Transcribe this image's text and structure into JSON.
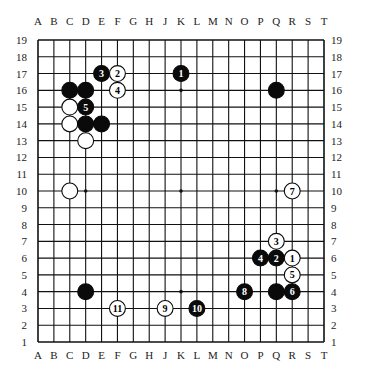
{
  "board": {
    "size": 19,
    "columns": [
      "A",
      "B",
      "C",
      "D",
      "E",
      "F",
      "G",
      "H",
      "J",
      "K",
      "L",
      "M",
      "N",
      "O",
      "P",
      "Q",
      "R",
      "S",
      "T"
    ],
    "rows": [
      19,
      18,
      17,
      16,
      15,
      14,
      13,
      12,
      11,
      10,
      9,
      8,
      7,
      6,
      5,
      4,
      3,
      2,
      1
    ],
    "star_points": [
      "D10",
      "K10",
      "Q10",
      "K16",
      "K4"
    ],
    "colors": {
      "line": "#111111",
      "black": "#0a0a0a",
      "white": "#ffffff",
      "background": "#ffffff"
    }
  },
  "stones": [
    {
      "pos": "E17",
      "color": "black",
      "label": "3"
    },
    {
      "pos": "F17",
      "color": "white",
      "label": "2"
    },
    {
      "pos": "K17",
      "color": "black",
      "label": "1"
    },
    {
      "pos": "C16",
      "color": "black",
      "label": ""
    },
    {
      "pos": "D16",
      "color": "black",
      "label": ""
    },
    {
      "pos": "F16",
      "color": "white",
      "label": "4"
    },
    {
      "pos": "Q16",
      "color": "black",
      "label": ""
    },
    {
      "pos": "C15",
      "color": "white",
      "label": ""
    },
    {
      "pos": "D15",
      "color": "black",
      "label": "5"
    },
    {
      "pos": "C14",
      "color": "white",
      "label": ""
    },
    {
      "pos": "D14",
      "color": "black",
      "label": ""
    },
    {
      "pos": "E14",
      "color": "black",
      "label": ""
    },
    {
      "pos": "D13",
      "color": "white",
      "label": ""
    },
    {
      "pos": "C10",
      "color": "white",
      "label": ""
    },
    {
      "pos": "R10",
      "color": "white",
      "label": "7"
    },
    {
      "pos": "Q7",
      "color": "white",
      "label": "3"
    },
    {
      "pos": "P6",
      "color": "black",
      "label": "4"
    },
    {
      "pos": "Q6",
      "color": "black",
      "label": "2"
    },
    {
      "pos": "R6",
      "color": "white",
      "label": "1"
    },
    {
      "pos": "R5",
      "color": "white",
      "label": "5"
    },
    {
      "pos": "D4",
      "color": "black",
      "label": ""
    },
    {
      "pos": "O4",
      "color": "black",
      "label": "8"
    },
    {
      "pos": "Q4",
      "color": "black",
      "label": ""
    },
    {
      "pos": "R4",
      "color": "black",
      "label": "6"
    },
    {
      "pos": "F3",
      "color": "white",
      "label": "11"
    },
    {
      "pos": "J3",
      "color": "white",
      "label": "9"
    },
    {
      "pos": "L3",
      "color": "black",
      "label": "10"
    }
  ]
}
